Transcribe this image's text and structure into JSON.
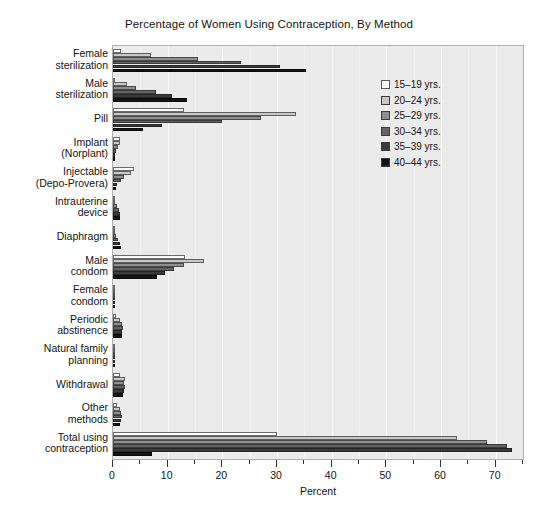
{
  "chart_data": {
    "type": "bar",
    "orientation": "horizontal",
    "title": "Percentage of Women Using Contraception, By Method",
    "xlabel": "Percent",
    "ylabel": "",
    "xlim": [
      0,
      75
    ],
    "ylim": null,
    "grid": true,
    "legend_position": "upper right",
    "xticks": [
      0,
      10,
      20,
      30,
      40,
      50,
      60,
      70
    ],
    "xtick_labels": [
      "0",
      "10",
      "20",
      "30",
      "40",
      "50",
      "60",
      "70"
    ],
    "minor_xticks": [
      5,
      15,
      25,
      35,
      45,
      55,
      65,
      75
    ],
    "categories": [
      "Female\nsterilization",
      "Male\nsterilization",
      "Pill",
      "Implant\n(Norplant)",
      "Injectable\n(Depo-Provera)",
      "Intrauterine\ndevice",
      "Diaphragm",
      "Male\ncondom",
      "Female\ncondom",
      "Periodic\nabstinence",
      "Natural family\nplanning",
      "Withdrawal",
      "Other\nmethods",
      "Total using\ncontraception"
    ],
    "series": [
      {
        "name": "15–19 yrs.",
        "color": "#fdfdfd",
        "values": [
          1.4,
          0.4,
          13.0,
          1.2,
          3.9,
          0.2,
          0.2,
          13.2,
          0.2,
          0.6,
          0.1,
          1.2,
          0.8,
          30.0
        ]
      },
      {
        "name": "20–24 yrs.",
        "color": "#c8c8c8",
        "values": [
          7.0,
          2.5,
          33.5,
          1.3,
          3.3,
          0.4,
          0.4,
          16.6,
          0.3,
          1.3,
          0.2,
          2.2,
          1.3,
          63.0
        ]
      },
      {
        "name": "25–29 yrs.",
        "color": "#8f8f8f",
        "values": [
          15.5,
          4.2,
          27.0,
          0.9,
          2.0,
          0.8,
          0.6,
          13.0,
          0.2,
          1.6,
          0.3,
          2.1,
          1.4,
          68.5
        ]
      },
      {
        "name": "30–34 yrs.",
        "color": "#636363",
        "values": [
          23.5,
          7.9,
          20.0,
          0.5,
          1.4,
          1.1,
          1.0,
          11.1,
          0.2,
          1.8,
          0.3,
          2.2,
          1.6,
          72.0
        ]
      },
      {
        "name": "35–39 yrs.",
        "color": "#3a3a3a",
        "values": [
          30.5,
          10.8,
          9.0,
          0.3,
          0.8,
          1.2,
          1.3,
          9.5,
          0.1,
          1.7,
          0.2,
          2.0,
          1.4,
          73.0
        ]
      },
      {
        "name": "40–44 yrs.",
        "color": "#141414",
        "values": [
          35.3,
          13.5,
          5.5,
          0.2,
          0.5,
          1.3,
          1.5,
          8.0,
          0.1,
          1.6,
          0.2,
          1.8,
          1.2,
          7.2
        ]
      }
    ]
  }
}
